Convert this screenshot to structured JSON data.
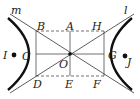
{
  "diagram": {
    "type": "hyperbola-with-asymptotes",
    "labels": {
      "m": "m",
      "l": "l",
      "A": "A",
      "B": "B",
      "H": "H",
      "I": "I",
      "C": "C",
      "O": "O",
      "G": "G",
      "J": "J",
      "D": "D",
      "E": "E",
      "F": "F"
    },
    "colors": {
      "stroke": "#222222",
      "background": "#ffffff"
    }
  }
}
